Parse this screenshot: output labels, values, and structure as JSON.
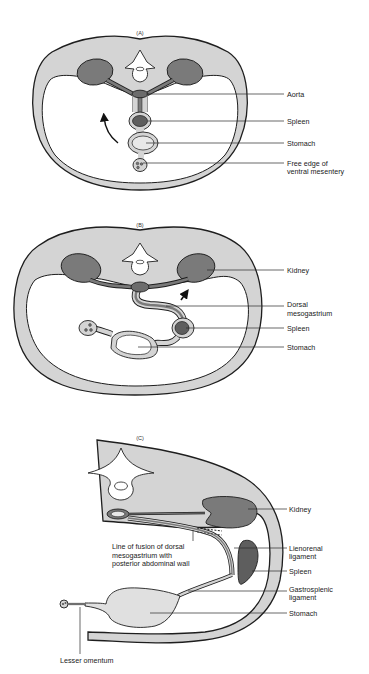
{
  "figure": {
    "panels": [
      {
        "id": "A",
        "label": "(A)",
        "callouts": [
          {
            "text": "Aorta"
          },
          {
            "text": "Spleen"
          },
          {
            "text": "Stomach"
          },
          {
            "text": "Free edge of",
            "text2": "ventral mesentery"
          }
        ]
      },
      {
        "id": "B",
        "label": "(B)",
        "callouts": [
          {
            "text": "Kidney"
          },
          {
            "text": "Dorsal",
            "text2": "mesogastrium"
          },
          {
            "text": "Spleen"
          },
          {
            "text": "Stomach"
          }
        ]
      },
      {
        "id": "C",
        "label": "(C)",
        "callouts": [
          {
            "text": "Kidney"
          },
          {
            "text": "Lienorenal",
            "text2": "ligament"
          },
          {
            "text": "Spleen"
          },
          {
            "text": "Gastrosplenic",
            "text2": "ligament"
          },
          {
            "text": "Stomach"
          }
        ],
        "annotation": {
          "line1": "Line of fusion of dorsal",
          "line2": "mesogastrium with",
          "line3": "posterior abdominal wall"
        },
        "bottom_label": "Lesser omentum"
      }
    ],
    "colors": {
      "body_wall": "#d4d4d4",
      "organ_dark": "#7a7a7a",
      "organ_light": "#e2e2e2",
      "outline": "#1e1e1e",
      "cavity": "#ffffff"
    }
  }
}
